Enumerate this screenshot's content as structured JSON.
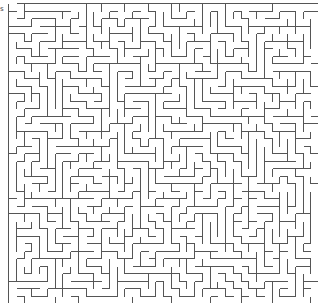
{
  "maze": {
    "cols": 40,
    "rows": 40,
    "cell_w": 7.75,
    "cell_h": 7.5,
    "wall_color": "#555555",
    "background": "#ffffff",
    "seed": 12345
  },
  "corner_mark": "s"
}
